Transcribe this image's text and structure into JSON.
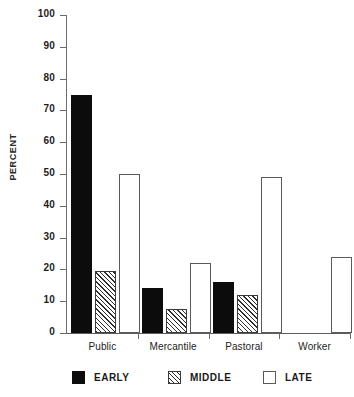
{
  "chart_data": {
    "type": "bar",
    "title": "",
    "xlabel": "",
    "ylabel": "PERCENT",
    "ylim": [
      0,
      100
    ],
    "ytick_step": 10,
    "ytick_labels": [
      "100",
      "90",
      "80",
      "70",
      "60",
      "50",
      "40",
      "30",
      "20",
      "10",
      "0"
    ],
    "grid": false,
    "legend_position": "bottom",
    "categories": [
      "Public",
      "Mercantile",
      "Pastoral",
      "Worker"
    ],
    "series": [
      {
        "name": "EARLY",
        "style": "solid-black",
        "color": "#0c0c0c",
        "values": [
          75,
          14,
          16,
          0
        ]
      },
      {
        "name": "MIDDLE",
        "style": "diagonal-hatch",
        "color": "#2f2f2f",
        "values": [
          19.5,
          7.5,
          12,
          0
        ]
      },
      {
        "name": "LATE",
        "style": "white-outline",
        "color": "#ffffff",
        "values": [
          50,
          22,
          49,
          24
        ]
      }
    ]
  },
  "legend": {
    "items": [
      {
        "label": "EARLY"
      },
      {
        "label": "MIDDLE"
      },
      {
        "label": "LATE"
      }
    ]
  }
}
